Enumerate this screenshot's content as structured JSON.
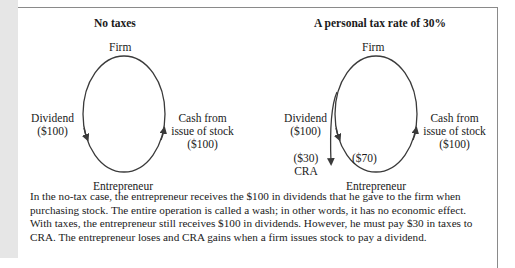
{
  "panels": [
    {
      "title": "No taxes",
      "top_label": "Firm",
      "bottom_label": "Entrepreneur",
      "left_label_line1": "Dividend",
      "left_label_line2": "($100)",
      "right_label_line1": "Cash from",
      "right_label_line2": "issue of stock",
      "right_label_line3": "($100)"
    },
    {
      "title": "A personal tax rate of 30%",
      "top_label": "Firm",
      "bottom_label": "Entrepreneur",
      "left_label_line1": "Dividend",
      "left_label_line2": "($100)",
      "right_label_line1": "Cash from",
      "right_label_line2": "issue of stock",
      "right_label_line3": "($100)",
      "tax_label_line1": "($30)",
      "tax_label_line2": "CRA",
      "net_label": "($70)"
    }
  ],
  "caption": {
    "lines": [
      "In the no-tax case, the entrepreneur receives the $100 in dividends that he gave to the firm when",
      "purchasing stock. The entire operation is called a wash; in other words, it has no economic effect.",
      "With taxes, the entrepreneur still receives $100 in dividends. However, he must pay $30 in taxes to",
      "CRA. The entrepreneur loses and CRA gains when a firm issues stock to pay a dividend."
    ]
  },
  "colors": {
    "line": "#3a3a3a",
    "frame": "#8a8a8a",
    "side_strip": "#e6e6e6"
  }
}
